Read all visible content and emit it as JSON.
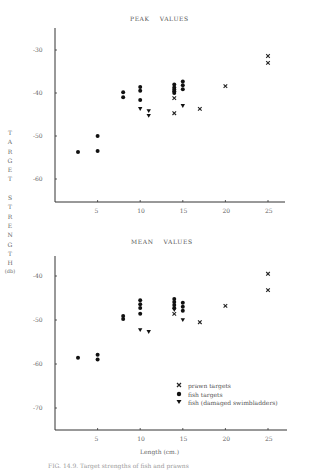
{
  "figure": {
    "ylabel_letters": [
      "T",
      "A",
      "R",
      "G",
      "E",
      "T",
      "",
      "S",
      "T",
      "R",
      "E",
      "N",
      "G",
      "T",
      "H",
      "(db)"
    ],
    "xlabel": "Length (cm.)",
    "caption": "FIG. 14.9. Target strengths of fish and prawns"
  },
  "legend": {
    "items": [
      {
        "marker": "x",
        "label": "prawn targets"
      },
      {
        "marker": "circle",
        "label": "fish targets"
      },
      {
        "marker": "triangle-down",
        "label": "fish (damaged swimbladders)"
      }
    ]
  },
  "chart_data": [
    {
      "type": "scatter",
      "title": "PEAK    VALUES",
      "xlabel": "Length (cm.)",
      "ylabel": "TARGET STRENGTH (db)",
      "xlim": [
        0,
        27
      ],
      "ylim": [
        -65,
        -25
      ],
      "xticks": [
        5,
        10,
        15,
        20,
        25
      ],
      "yticks": [
        -30,
        -40,
        -50,
        -60
      ],
      "grid": false,
      "legend_position": "none",
      "series": [
        {
          "name": "prawn targets",
          "marker": "x",
          "points": [
            [
              14,
              -41.2
            ],
            [
              14,
              -44.7
            ],
            [
              17,
              -43.7
            ],
            [
              20,
              -38.4
            ],
            [
              25,
              -31.4
            ],
            [
              25,
              -33.0
            ]
          ]
        },
        {
          "name": "fish targets",
          "marker": "circle",
          "points": [
            [
              2.7,
              -53.7
            ],
            [
              5,
              -50.0
            ],
            [
              5,
              -53.5
            ],
            [
              8,
              -39.8
            ],
            [
              8,
              -41.0
            ],
            [
              10,
              -38.6
            ],
            [
              10,
              -39.5
            ],
            [
              10,
              -41.6
            ],
            [
              14,
              -38.0
            ],
            [
              14,
              -38.7
            ],
            [
              14,
              -39.2
            ],
            [
              14,
              -39.6
            ],
            [
              14,
              -40.0
            ],
            [
              15,
              -37.3
            ],
            [
              15,
              -38.2
            ],
            [
              15,
              -39.1
            ]
          ]
        },
        {
          "name": "fish (damaged swimbladders)",
          "marker": "triangle-down",
          "points": [
            [
              10,
              -43.7
            ],
            [
              11,
              -44.2
            ],
            [
              11,
              -45.3
            ],
            [
              15,
              -43.0
            ]
          ]
        }
      ]
    },
    {
      "type": "scatter",
      "title": "MEAN    VALUES",
      "xlabel": "Length (cm.)",
      "ylabel": "TARGET STRENGTH (db)",
      "xlim": [
        0,
        27
      ],
      "ylim": [
        -75,
        -35
      ],
      "xticks": [
        5,
        10,
        15,
        20,
        25
      ],
      "yticks": [
        -40,
        -50,
        -60,
        -70
      ],
      "grid": false,
      "legend_position": "lower right",
      "series": [
        {
          "name": "prawn targets",
          "marker": "x",
          "points": [
            [
              14,
              -48.6
            ],
            [
              17,
              -50.5
            ],
            [
              20,
              -46.8
            ],
            [
              25,
              -39.5
            ],
            [
              25,
              -43.2
            ]
          ]
        },
        {
          "name": "fish targets",
          "marker": "circle",
          "points": [
            [
              2.7,
              -58.6
            ],
            [
              5,
              -57.9
            ],
            [
              5,
              -59.0
            ],
            [
              8,
              -49.1
            ],
            [
              8,
              -49.8
            ],
            [
              10,
              -45.5
            ],
            [
              10,
              -46.4
            ],
            [
              10,
              -47.3
            ],
            [
              10,
              -48.6
            ],
            [
              14,
              -45.2
            ],
            [
              14,
              -45.9
            ],
            [
              14,
              -46.6
            ],
            [
              14,
              -47.3
            ],
            [
              15,
              -46.1
            ],
            [
              15,
              -47.0
            ],
            [
              15,
              -47.9
            ]
          ]
        },
        {
          "name": "fish (damaged swimbladders)",
          "marker": "triangle-down",
          "points": [
            [
              10,
              -52.3
            ],
            [
              11,
              -52.7
            ],
            [
              15,
              -50.0
            ],
            [
              14,
              -47.7
            ]
          ]
        }
      ]
    }
  ]
}
